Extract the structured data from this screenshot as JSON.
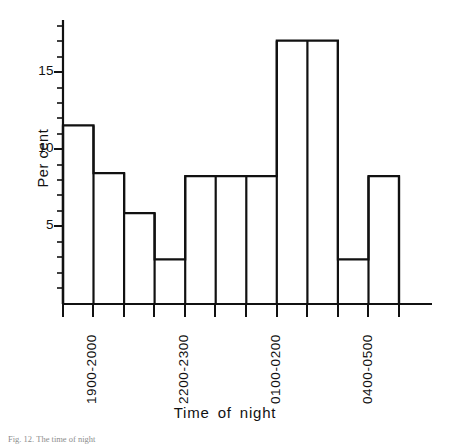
{
  "chart_data": {
    "type": "bar",
    "title": "",
    "subtitle": "",
    "xlabel": "Time of night",
    "ylabel": "Per cent",
    "ylim": [
      0,
      18
    ],
    "yticks": [
      5,
      10,
      15
    ],
    "ytick_labels": [
      "5",
      "10",
      "15"
    ],
    "minor_yticks": [
      1,
      2,
      3,
      4,
      6,
      7,
      8,
      9,
      11,
      12,
      13,
      14,
      16,
      17
    ],
    "grid": false,
    "legend": null,
    "bar_style": "outlined-histogram",
    "bar_fill": "#ffffff",
    "bar_stroke": "#111111",
    "axis_color": "#111111",
    "categories": [
      "1900-2000",
      "2000-2100",
      "2100-2200",
      "2200-2300",
      "2300-0000",
      "0000-0100",
      "0100-0200",
      "0200-0300",
      "0300-0400",
      "0400-0500",
      "0500-0600"
    ],
    "values": [
      11.6,
      8.5,
      5.9,
      2.9,
      8.3,
      8.3,
      8.3,
      17.1,
      17.1,
      2.9,
      8.3
    ],
    "labelled_categories": [
      {
        "index": 0,
        "label": "1900-2000"
      },
      {
        "index": 3,
        "label": "2200-2300"
      },
      {
        "index": 6,
        "label": "0100-0200"
      },
      {
        "index": 9,
        "label": "0400-0500"
      }
    ],
    "annotations": []
  },
  "axes": {
    "y_title": "Per cent",
    "x_title": "Time of night"
  },
  "caption": {
    "text": "Fig. 12.  The time of night"
  }
}
